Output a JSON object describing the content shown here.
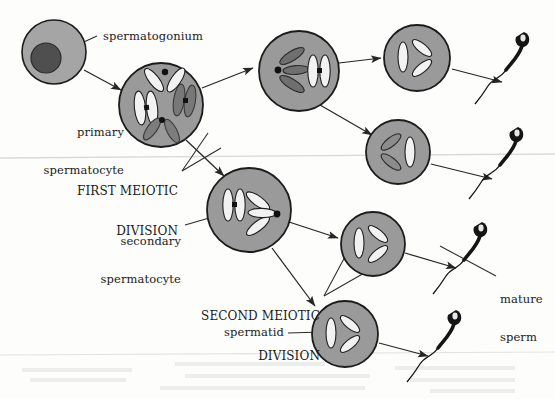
{
  "figure": {
    "background_color": "#fdfdfc",
    "cell_fill": "#9a9a9a",
    "cell_stroke": "#1c1c1c",
    "nucleus_fill": "#4a4a4a",
    "chromosome_light": "#f2f2f2",
    "chromosome_dark": "#6f6f6f",
    "ink_color": "#1a1a1a"
  },
  "labels": {
    "spermatogonium": "spermatogonium",
    "primary_spermatocyte_line1": "primary",
    "primary_spermatocyte_line2": "spermatocyte",
    "first_meiotic_line1": "FIRST MEIOTIC",
    "first_meiotic_line2": "DIVISION",
    "secondary_spermatocyte_line1": "secondary",
    "secondary_spermatocyte_line2": "spermatocyte",
    "second_meiotic_line1": "SECOND MEIOTIC",
    "second_meiotic_line2": "DIVISION",
    "spermatid": "spermatid",
    "mature_sperm_line1": "mature",
    "mature_sperm_line2": "sperm"
  },
  "cells": [
    {
      "name": "spermatogonium",
      "cx": 54,
      "cy": 52,
      "r": 32,
      "kind": "nucleated"
    },
    {
      "name": "primary-spermatocyte",
      "cx": 161,
      "cy": 105,
      "r": 42,
      "kind": "primary"
    },
    {
      "name": "secondary-spermatocyte-upper",
      "cx": 299,
      "cy": 71,
      "r": 40,
      "kind": "secondary-upper"
    },
    {
      "name": "secondary-spermatocyte-lower",
      "cx": 249,
      "cy": 210,
      "r": 42,
      "kind": "secondary-lower"
    },
    {
      "name": "spermatid-1",
      "cx": 417,
      "cy": 58,
      "r": 33,
      "kind": "spermatid-a"
    },
    {
      "name": "spermatid-2",
      "cx": 398,
      "cy": 152,
      "r": 32,
      "kind": "spermatid-b"
    },
    {
      "name": "spermatid-3",
      "cx": 373,
      "cy": 244,
      "r": 32,
      "kind": "spermatid-a"
    },
    {
      "name": "spermatid-4",
      "cx": 345,
      "cy": 334,
      "r": 33,
      "kind": "spermatid-a"
    }
  ],
  "sperm": [
    {
      "name": "mature-sperm-1",
      "hx": 524,
      "hy": 38
    },
    {
      "name": "mature-sperm-2",
      "hx": 518,
      "hy": 133
    },
    {
      "name": "mature-sperm-3",
      "hx": 482,
      "hy": 228
    },
    {
      "name": "mature-sperm-4",
      "hx": 456,
      "hy": 316
    }
  ]
}
